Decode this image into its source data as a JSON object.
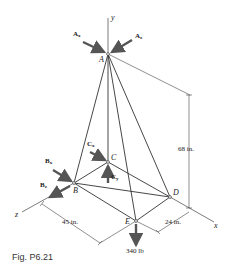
{
  "figure": {
    "caption": "Fig. P6.21",
    "axes": {
      "x": "x",
      "y": "y",
      "z": "z"
    },
    "points": {
      "A": "A",
      "B": "B",
      "C": "C",
      "D": "D",
      "E": "E"
    },
    "forces": {
      "Ax_main": "A",
      "Ax_sub": "x",
      "Az_main": "A",
      "Az_sub": "z",
      "Bx_main": "B",
      "Bx_sub": "x",
      "Bz_main": "B",
      "Bz_sub": "z",
      "Cx_main": "C",
      "Cx_sub": "x",
      "Cy_main": "C",
      "Cy_sub": "y",
      "load": "340 lb"
    },
    "dimensions": {
      "height": "68 in.",
      "bz": "45 in.",
      "ex": "24 in."
    },
    "colors": {
      "line": "#333333",
      "arrow": "#555555",
      "background": "#ffffff"
    }
  }
}
